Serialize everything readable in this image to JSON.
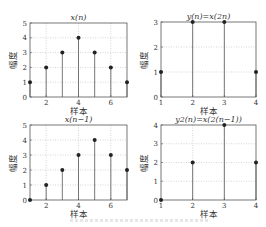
{
  "chart_data": [
    {
      "type": "stem",
      "title": "x(n)",
      "xlabel": "样本",
      "ylabel": "幅度",
      "x": [
        1,
        2,
        3,
        4,
        5,
        6,
        7
      ],
      "values": [
        1,
        2,
        3,
        4,
        3,
        2,
        1
      ],
      "xlim": [
        1,
        7
      ],
      "ylim": [
        0,
        5
      ],
      "xticks": [
        2,
        4,
        6
      ],
      "yticks": [
        0,
        1,
        2,
        3,
        4,
        5
      ],
      "grid": true,
      "box": {
        "left": 30,
        "right": 127,
        "top": 23,
        "bottom": 97
      }
    },
    {
      "type": "stem",
      "title": "y(n)=x(2n)",
      "xlabel": "样本",
      "ylabel": "幅度",
      "x": [
        1,
        2,
        3,
        4
      ],
      "values": [
        1,
        3,
        3,
        1
      ],
      "xlim": [
        1,
        4
      ],
      "ylim": [
        0,
        3
      ],
      "xticks": [
        1,
        2,
        3,
        4
      ],
      "yticks": [
        0,
        1,
        2,
        3
      ],
      "grid": true,
      "box": {
        "left": 161,
        "right": 256,
        "top": 22,
        "bottom": 97
      }
    },
    {
      "type": "stem",
      "title": "x(n−1)",
      "xlabel": "样本",
      "ylabel": "幅度",
      "x": [
        1,
        2,
        3,
        4,
        5,
        6,
        7
      ],
      "values": [
        0,
        1,
        2,
        3,
        4,
        3,
        2
      ],
      "xlim": [
        1,
        7
      ],
      "ylim": [
        0,
        5
      ],
      "xticks": [
        2,
        4,
        6
      ],
      "yticks": [
        0,
        1,
        2,
        3,
        4,
        5
      ],
      "grid": true,
      "box": {
        "left": 30,
        "right": 127,
        "top": 125,
        "bottom": 200
      }
    },
    {
      "type": "stem",
      "title": "y2(n)=x(2(n−1))",
      "xlabel": "样本",
      "ylabel": "幅度",
      "x": [
        1,
        2,
        3,
        4
      ],
      "values": [
        0,
        2,
        4,
        2
      ],
      "xlim": [
        1,
        4
      ],
      "ylim": [
        0,
        4
      ],
      "xticks": [
        1,
        2,
        3,
        4
      ],
      "yticks": [
        0,
        1,
        2,
        3,
        4
      ],
      "grid": true,
      "box": {
        "left": 161,
        "right": 256,
        "top": 125,
        "bottom": 200
      }
    }
  ],
  "style": {
    "axis_color": "#555555",
    "grid_color": "#bbbbbb",
    "stem_color": "#555555",
    "marker_color": "#222222",
    "text_color": "#333333"
  }
}
